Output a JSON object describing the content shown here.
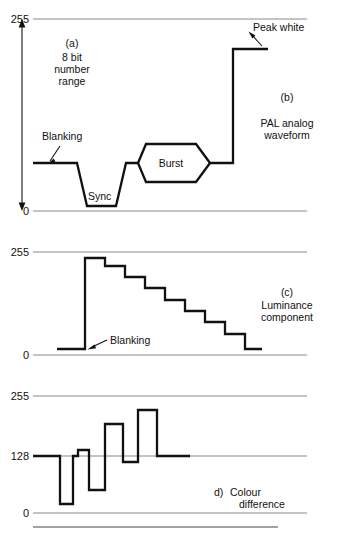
{
  "figure": {
    "ink_color": "#111111",
    "grid_color": "#8a8a8a",
    "background": "#ffffff"
  },
  "panels": [
    {
      "id": "pal-analog-waveform",
      "caption_letter": "(b)",
      "caption_lines": [
        "PAL analog",
        "waveform"
      ],
      "side_note_letter": "(a)",
      "side_note_lines": [
        "8 bit",
        "number",
        "range"
      ],
      "axis": {
        "top_label": "255",
        "bottom_label": "0",
        "top_y": 19,
        "bottom_y": 211,
        "line_x1": 33,
        "line_x2": 307,
        "arrow_x": 22
      },
      "levels": {
        "blanking": 163,
        "sync_bottom": 206,
        "burst_top": 144,
        "burst_bottom": 182,
        "peak_white": 49
      },
      "annotations": [
        {
          "name": "blanking",
          "text": "Blanking",
          "x": 42,
          "y": 140
        },
        {
          "name": "sync",
          "text": "Sync",
          "x": 88,
          "y": 200
        },
        {
          "name": "burst",
          "text": "Burst",
          "x": 152,
          "y": 167
        },
        {
          "name": "peak-white",
          "text": "Peak white",
          "x": 253,
          "y": 31
        }
      ]
    },
    {
      "id": "luminance-component",
      "caption_letter": "(c)",
      "caption_lines": [
        "Luminance",
        "component"
      ],
      "axis": {
        "top_label": "255",
        "bottom_label": "0",
        "top_y": 252,
        "bottom_y": 355,
        "line_x1": 33,
        "line_x2": 307
      },
      "annotations": [
        {
          "name": "blanking",
          "text": "Blanking",
          "x": 110,
          "y": 344
        }
      ],
      "staircase": {
        "blanking_level": 349,
        "step_levels": [
          258,
          266,
          277,
          288,
          300,
          311,
          322,
          334
        ],
        "start_x": 57,
        "rise_x": 85,
        "step_width": 20,
        "end_x": 262
      }
    },
    {
      "id": "colour-difference",
      "caption_letter": "d)",
      "caption_lines": [
        "Colour",
        "difference"
      ],
      "axis": {
        "top_label": "255",
        "mid_label": "128",
        "bottom_label": "0",
        "top_y": 396,
        "mid_y": 456,
        "bottom_y": 513,
        "line_x1": 33,
        "line_x2": 307
      },
      "pulses": [
        {
          "x1": 33,
          "x2": 60,
          "y": 456
        },
        {
          "x1": 60,
          "x2": 73,
          "y": 504
        },
        {
          "x1": 73,
          "x2": 78,
          "y": 456
        },
        {
          "x1": 78,
          "x2": 89,
          "y": 450
        },
        {
          "x1": 89,
          "x2": 105,
          "y": 490
        },
        {
          "x1": 105,
          "x2": 123,
          "y": 424
        },
        {
          "x1": 123,
          "x2": 138,
          "y": 462
        },
        {
          "x1": 138,
          "x2": 157,
          "y": 410
        },
        {
          "x1": 157,
          "x2": 190,
          "y": 456
        }
      ]
    }
  ],
  "footer": {
    "rule_y": 527,
    "rule_x1": 33,
    "rule_x2": 278
  }
}
